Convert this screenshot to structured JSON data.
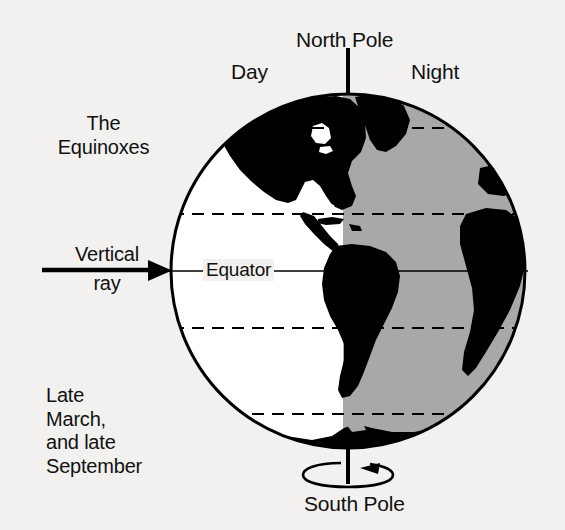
{
  "diagram": {
    "title": "The Equinoxes",
    "labels": {
      "north_pole": "North Pole",
      "south_pole": "South Pole",
      "day": "Day",
      "night": "Night",
      "equinoxes": "The\nEquinoxes",
      "vertical": "Vertical",
      "ray": "ray",
      "equator": "Equator",
      "dates": "Late\nMarch,\nand late\nSeptember"
    },
    "colors": {
      "background": "#f2f1ef",
      "land": "#000000",
      "day_ocean": "#ffffff",
      "night_shade": "#a8a8a8",
      "outline": "#000000"
    },
    "geometry": {
      "globe_center_x": 348,
      "globe_center_y": 271,
      "globe_radius": 178,
      "terminator_x": 343,
      "equator_y": 271
    },
    "latitude_lines": [
      {
        "name": "arctic-circle",
        "y": 128,
        "style": "dashed"
      },
      {
        "name": "tropic-of-cancer",
        "y": 214,
        "style": "dashed"
      },
      {
        "name": "equator",
        "y": 271,
        "style": "solid"
      },
      {
        "name": "tropic-of-capricorn",
        "y": 328,
        "style": "dashed"
      },
      {
        "name": "antarctic-circle",
        "y": 414,
        "style": "dashed"
      }
    ]
  }
}
